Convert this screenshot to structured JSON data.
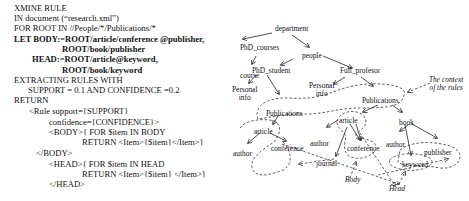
{
  "code": {
    "lines": [
      {
        "text": "XMINE RULE",
        "bold": false,
        "x": 14,
        "y": 10
      },
      {
        "text": "IN document (“research.xml”)",
        "bold": false,
        "x": 14,
        "y": 20
      },
      {
        "text": "FOR ROOT IN //People/*/Publications/*",
        "bold": false,
        "x": 14,
        "y": 30
      },
      {
        "text": "LET BODY:=ROOT/article/conference @publisher,",
        "bold": true,
        "x": 14,
        "y": 41
      },
      {
        "text": "ROOT/book/publisher",
        "bold": true,
        "x": 62,
        "y": 51
      },
      {
        "text": "HEAD:=ROOT/article@keyword,",
        "bold": true,
        "x": 32,
        "y": 61
      },
      {
        "text": "ROOT/book/keyword",
        "bold": true,
        "x": 62,
        "y": 72
      },
      {
        "text": "EXTRACTING RULES WITH",
        "bold": false,
        "x": 14,
        "y": 82
      },
      {
        "text": "SUPPORT = 0.1 AND CONFIDENCE =0.2",
        "bold": false,
        "x": 28,
        "y": 92
      },
      {
        "text": "RETURN",
        "bold": false,
        "x": 14,
        "y": 102
      },
      {
        "text": "<Rule support={SUPPORT}",
        "bold": false,
        "x": 29,
        "y": 113
      },
      {
        "text": "confidence={CONFIDENCE}>",
        "bold": false,
        "x": 49,
        "y": 124
      },
      {
        "text": "<BODY>{ FOR $item IN BODY",
        "bold": false,
        "x": 49,
        "y": 134
      },
      {
        "text": "RETURN <Item>{$item}</Item>}",
        "bold": false,
        "x": 82,
        "y": 144
      },
      {
        "text": "</BODY>",
        "bold": false,
        "x": 36,
        "y": 155
      },
      {
        "text": "<HEAD>{ FOR $item IN HEAD",
        "bold": false,
        "x": 49,
        "y": 166
      },
      {
        "text": "RETURN <Item>{$item} </Item>}",
        "bold": false,
        "x": 82,
        "y": 176
      },
      {
        "text": "</HEAD>",
        "bold": false,
        "x": 49,
        "y": 186
      }
    ]
  },
  "diagram": {
    "nodes": {
      "department": "department",
      "phd_courses": "PhD_courses",
      "course": "course",
      "people": "people",
      "phd_student": "PhD_student",
      "full_professor": "Full_profesor",
      "personal_info_left_1": "Personal",
      "personal_info_left_2": "info",
      "personal_info_right_1": "Personal",
      "personal_info_right_2": "info",
      "publications_left": "Publications",
      "publications_right": "Publications",
      "article_left": "article",
      "author_left": "author",
      "conference_left": "conference",
      "article_right": "article",
      "author_mid": "author",
      "journal": "journal",
      "conference_right": "conference",
      "book": "book",
      "author_right": "author",
      "publisher": "publisher",
      "keyword": "keyword"
    },
    "annotations": {
      "context_1": "The context",
      "context_2": "of the rules",
      "body": "Body",
      "head": "Head"
    }
  }
}
